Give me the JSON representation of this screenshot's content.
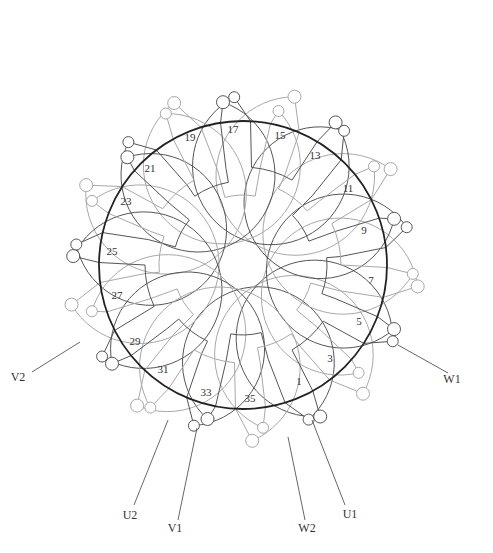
{
  "diagram": {
    "type": "stator-winding-diagram",
    "colors": {
      "stator_ring": "#222222",
      "coil_dark": "#555555",
      "coil_light": "#a8a8a8",
      "background": "#ffffff"
    },
    "geometry": {
      "cx": 243,
      "cy": 265,
      "ring_r": 144,
      "inner_r1": 70,
      "inner_r2": 84,
      "inner_r3": 98,
      "slots": 36
    },
    "slot_labels": [
      {
        "text": "1",
        "x": 299,
        "y": 385
      },
      {
        "text": "3",
        "x": 330,
        "y": 362
      },
      {
        "text": "5",
        "x": 359,
        "y": 325
      },
      {
        "text": "7",
        "x": 371,
        "y": 284
      },
      {
        "text": "9",
        "x": 364,
        "y": 234
      },
      {
        "text": "11",
        "x": 348,
        "y": 192
      },
      {
        "text": "13",
        "x": 315,
        "y": 159
      },
      {
        "text": "15",
        "x": 280,
        "y": 139
      },
      {
        "text": "17",
        "x": 233,
        "y": 133
      },
      {
        "text": "19",
        "x": 190,
        "y": 141
      },
      {
        "text": "21",
        "x": 150,
        "y": 172
      },
      {
        "text": "23",
        "x": 126,
        "y": 205
      },
      {
        "text": "25",
        "x": 112,
        "y": 255
      },
      {
        "text": "27",
        "x": 117,
        "y": 299
      },
      {
        "text": "29",
        "x": 135,
        "y": 345
      },
      {
        "text": "31",
        "x": 163,
        "y": 373
      },
      {
        "text": "33",
        "x": 206,
        "y": 396
      },
      {
        "text": "35",
        "x": 250,
        "y": 402
      }
    ],
    "terminal_labels": [
      {
        "text": "W1",
        "x": 452,
        "y": 383
      },
      {
        "text": "V2",
        "x": 18,
        "y": 381
      },
      {
        "text": "U2",
        "x": 130,
        "y": 519
      },
      {
        "text": "V1",
        "x": 175,
        "y": 532
      },
      {
        "text": "W2",
        "x": 307,
        "y": 532
      },
      {
        "text": "U1",
        "x": 350,
        "y": 518
      }
    ]
  }
}
